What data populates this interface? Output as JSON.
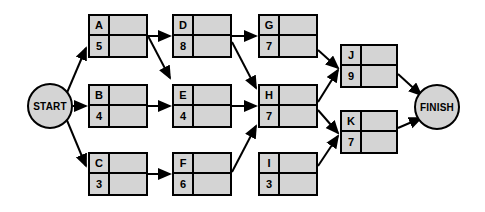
{
  "diagram": {
    "type": "project-network-diagram",
    "background_color": "#ffffff",
    "node_fill_color": "#d4d4d4",
    "node_border_color": "#000000",
    "edge_color": "#000000"
  },
  "terminals": [
    {
      "key": "START",
      "label": "START",
      "cx": 50,
      "cy": 106,
      "r": 23
    },
    {
      "key": "FINISH",
      "label": "FINISH",
      "cx": 437,
      "cy": 107,
      "r": 23
    }
  ],
  "nodes": [
    {
      "key": "A",
      "id": "A",
      "duration": "5",
      "es": "",
      "ef": "",
      "x": 88,
      "y": 14,
      "w": 60,
      "h": 44
    },
    {
      "key": "B",
      "id": "B",
      "duration": "4",
      "es": "",
      "ef": "",
      "x": 88,
      "y": 84,
      "w": 60,
      "h": 44
    },
    {
      "key": "C",
      "id": "C",
      "duration": "3",
      "es": "",
      "ef": "",
      "x": 88,
      "y": 152,
      "w": 60,
      "h": 44
    },
    {
      "key": "D",
      "id": "D",
      "duration": "8",
      "es": "",
      "ef": "",
      "x": 172,
      "y": 14,
      "w": 60,
      "h": 44
    },
    {
      "key": "E",
      "id": "E",
      "duration": "4",
      "es": "",
      "ef": "",
      "x": 172,
      "y": 84,
      "w": 60,
      "h": 44
    },
    {
      "key": "F",
      "id": "F",
      "duration": "6",
      "es": "",
      "ef": "",
      "x": 172,
      "y": 152,
      "w": 60,
      "h": 44
    },
    {
      "key": "G",
      "id": "G",
      "duration": "7",
      "es": "",
      "ef": "",
      "x": 258,
      "y": 14,
      "w": 60,
      "h": 44
    },
    {
      "key": "H",
      "id": "H",
      "duration": "7",
      "es": "",
      "ef": "",
      "x": 258,
      "y": 84,
      "w": 60,
      "h": 44
    },
    {
      "key": "I",
      "id": "I",
      "duration": "3",
      "es": "",
      "ef": "",
      "x": 258,
      "y": 152,
      "w": 60,
      "h": 44
    },
    {
      "key": "J",
      "id": "J",
      "duration": "9",
      "es": "",
      "ef": "",
      "x": 340,
      "y": 44,
      "w": 58,
      "h": 44
    },
    {
      "key": "K",
      "id": "K",
      "duration": "7",
      "es": "",
      "ef": "",
      "x": 340,
      "y": 110,
      "w": 58,
      "h": 44
    }
  ],
  "edges": [
    {
      "from": "START",
      "to": "A",
      "x1": 66,
      "y1": 95,
      "x2": 86,
      "y2": 48
    },
    {
      "from": "START",
      "to": "B",
      "x1": 73,
      "y1": 106,
      "x2": 86,
      "y2": 106
    },
    {
      "from": "START",
      "to": "C",
      "x1": 66,
      "y1": 118,
      "x2": 86,
      "y2": 166
    },
    {
      "from": "A",
      "to": "D",
      "x1": 148,
      "y1": 36,
      "x2": 170,
      "y2": 36
    },
    {
      "from": "A",
      "to": "E",
      "x1": 148,
      "y1": 36,
      "x2": 170,
      "y2": 78
    },
    {
      "from": "B",
      "to": "E",
      "x1": 148,
      "y1": 106,
      "x2": 170,
      "y2": 106
    },
    {
      "from": "C",
      "to": "F",
      "x1": 148,
      "y1": 174,
      "x2": 170,
      "y2": 174
    },
    {
      "from": "D",
      "to": "G",
      "x1": 232,
      "y1": 36,
      "x2": 256,
      "y2": 36
    },
    {
      "from": "D",
      "to": "H",
      "x1": 232,
      "y1": 42,
      "x2": 256,
      "y2": 88
    },
    {
      "from": "E",
      "to": "H",
      "x1": 232,
      "y1": 106,
      "x2": 256,
      "y2": 106
    },
    {
      "from": "F",
      "to": "H",
      "x1": 232,
      "y1": 172,
      "x2": 256,
      "y2": 126
    },
    {
      "from": "G",
      "to": "J",
      "x1": 318,
      "y1": 50,
      "x2": 338,
      "y2": 68
    },
    {
      "from": "H",
      "to": "J",
      "x1": 318,
      "y1": 102,
      "x2": 338,
      "y2": 70
    },
    {
      "from": "H",
      "to": "K",
      "x1": 318,
      "y1": 110,
      "x2": 338,
      "y2": 133
    },
    {
      "from": "I",
      "to": "K",
      "x1": 318,
      "y1": 166,
      "x2": 338,
      "y2": 136
    },
    {
      "from": "J",
      "to": "FINISH",
      "x1": 398,
      "y1": 74,
      "x2": 421,
      "y2": 95
    },
    {
      "from": "K",
      "to": "FINISH",
      "x1": 398,
      "y1": 128,
      "x2": 421,
      "y2": 118
    }
  ]
}
